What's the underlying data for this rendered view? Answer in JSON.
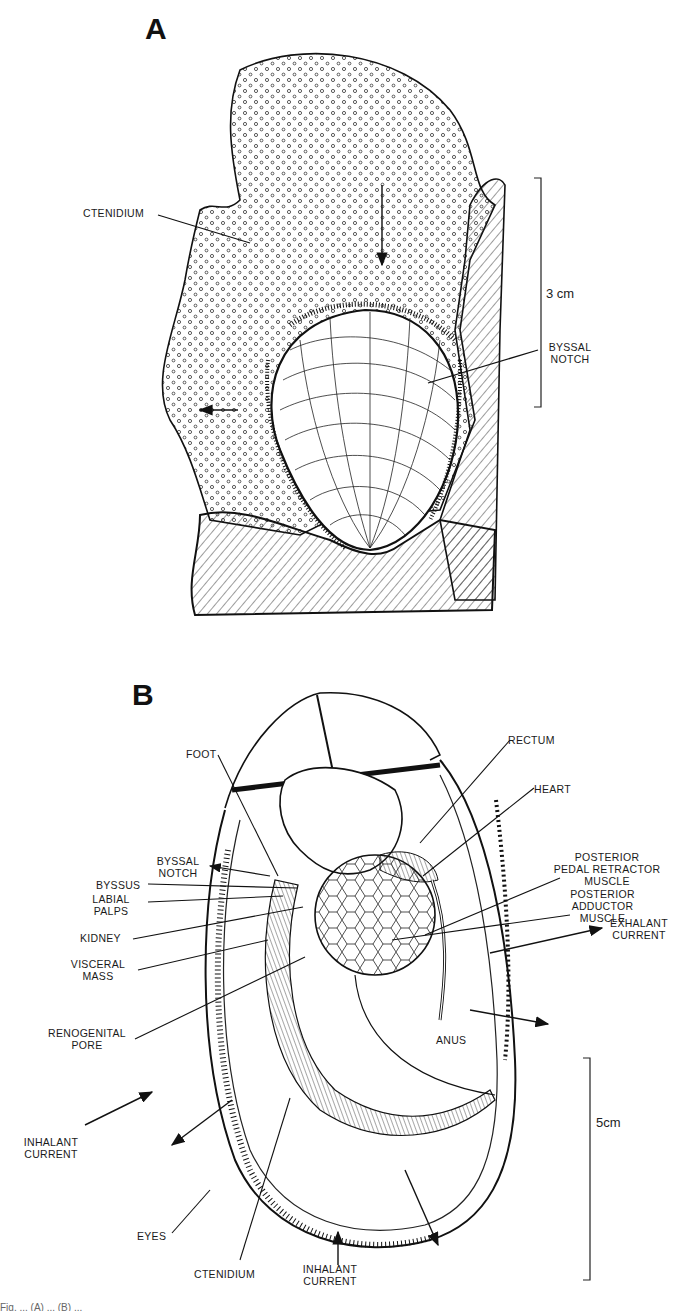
{
  "figure": {
    "panel_a": {
      "letter": "A",
      "labels": {
        "ctenidium": "CTENIDIUM",
        "byssal_notch_1": "BYSSAL",
        "byssal_notch_2": "NOTCH"
      },
      "scale_bar": {
        "label": "3 cm"
      }
    },
    "panel_b": {
      "letter": "B",
      "labels": {
        "foot": "FOOT",
        "rectum": "RECTUM",
        "heart": "HEART",
        "byssal_notch_1": "BYSSAL",
        "byssal_notch_2": "NOTCH",
        "byssus": "BYSSUS",
        "labial_palps_1": "LABIAL",
        "labial_palps_2": "PALPS",
        "post_pedal_1": "POSTERIOR",
        "post_pedal_2": "PEDAL RETRACTOR",
        "post_pedal_3": "MUSCLE",
        "kidney": "KIDNEY",
        "post_adductor_1": "POSTERIOR",
        "post_adductor_2": "ADDUCTOR",
        "post_adductor_3": "MUSCLE",
        "visceral_1": "VISCERAL",
        "visceral_2": "MASS",
        "exhalant_1": "EXHALANT",
        "exhalant_2": "CURRENT",
        "renogenital_1": "RENOGENITAL",
        "renogenital_2": "PORE",
        "anus": "ANUS",
        "inhalant_left_1": "INHALANT",
        "inhalant_left_2": "CURRENT",
        "eyes": "EYES",
        "ctenidium": "CTENIDIUM",
        "inhalant_bottom_1": "INHALANT",
        "inhalant_bottom_2": "CURRENT"
      },
      "scale_bar": {
        "label": "5cm"
      }
    },
    "caption_fragment": "Fig. ... (A) ... (B) ..."
  }
}
